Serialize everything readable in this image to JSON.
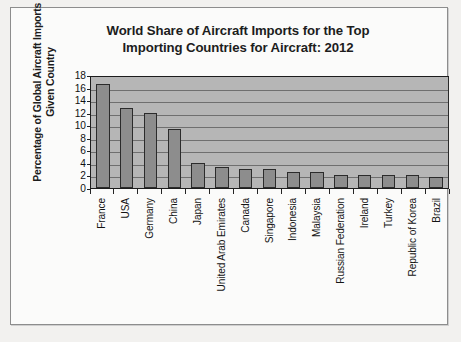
{
  "chart_data": {
    "type": "bar",
    "title": "World Share of Aircraft Imports for the Top Importing Countries for Aircraft: 2012",
    "title_lines": [
      "World Share of Aircraft Imports for the Top",
      "Importing Countries for Aircraft: 2012"
    ],
    "ylabel": "Percentage of Global Aircraft Imports of a Given Country",
    "ylabel_lines": [
      "Percentage of Global Aircraft Imports of a",
      "Given Country"
    ],
    "xlabel": "",
    "ylim": [
      0,
      18
    ],
    "ytick_values": [
      18,
      16,
      14,
      12,
      10,
      8,
      6,
      4,
      2,
      0
    ],
    "ytick_labels": [
      "18",
      "16",
      "14",
      "12",
      "10",
      "8",
      "6",
      "4",
      "2",
      "0"
    ],
    "grid": true,
    "grid_axis": "y",
    "legend": "none",
    "categories": [
      "France",
      "USA",
      "Germany",
      "China",
      "Japan",
      "United Arab Emirates",
      "Canada",
      "Singapore",
      "Indonesia",
      "Malaysia",
      "Russian Federation",
      "Ireland",
      "Turkey",
      "Republic of Korea",
      "Brazil"
    ],
    "values": [
      16.5,
      12.8,
      12.0,
      9.4,
      4.0,
      3.4,
      3.1,
      3.1,
      2.5,
      2.5,
      2.1,
      2.0,
      2.0,
      2.0,
      1.8
    ],
    "bar_color": "#8d8d8d",
    "bar_edge_color": "#2b2b2b",
    "plot_background": "#b6b6b6",
    "gridline_color": "#6f6f6f",
    "axis_color": "#1c1c1c",
    "page_background": "#fbfbfa",
    "frame_color": "#8d8d8d"
  }
}
